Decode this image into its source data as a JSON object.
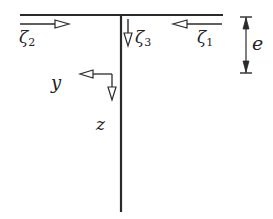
{
  "figure": {
    "colors": {
      "line": "#2a2a2a",
      "background": "#ffffff"
    },
    "labels": {
      "zeta2": {
        "symbol": "ζ",
        "sub": "2"
      },
      "zeta3": {
        "symbol": "ζ",
        "sub": "3"
      },
      "zeta1": {
        "symbol": "ζ",
        "sub": "1"
      },
      "e": "e",
      "y": "y",
      "z": "z"
    }
  }
}
